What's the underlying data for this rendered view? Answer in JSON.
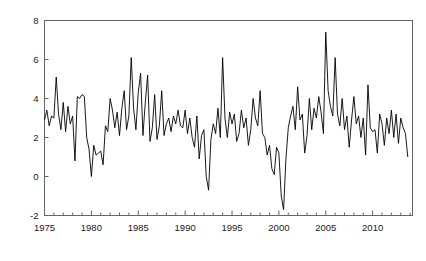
{
  "chart_data": {
    "type": "line",
    "title": "",
    "xlabel": "",
    "ylabel": "",
    "xlim": [
      1975.0,
      2014.25
    ],
    "ylim": [
      -2,
      8
    ],
    "grid": false,
    "legend": null,
    "x_ticks": [
      1975,
      1980,
      1985,
      1990,
      1995,
      2000,
      2005,
      2010
    ],
    "x_tick_labels": [
      "1975",
      "1980",
      "1985",
      "1990",
      "1995",
      "2000",
      "2005",
      "2010"
    ],
    "x_minor_tick_step": 1,
    "y_ticks": [
      -2,
      0,
      2,
      4,
      6,
      8
    ],
    "y_tick_labels": [
      "-2",
      "0",
      "2",
      "4",
      "6",
      "8"
    ],
    "line_color": "#000000",
    "line_width": 0.9,
    "series": [
      {
        "name": "series-1",
        "x_start": 1975.0,
        "x_step": 0.25,
        "values": [
          2.9,
          3.4,
          2.6,
          3.1,
          3.0,
          5.1,
          3.2,
          2.4,
          3.8,
          2.3,
          3.6,
          2.7,
          3.1,
          0.8,
          4.1,
          4.0,
          4.2,
          4.1,
          2.0,
          1.4,
          0.0,
          1.6,
          1.1,
          1.2,
          1.3,
          0.6,
          2.6,
          2.3,
          4.0,
          3.4,
          2.5,
          3.3,
          2.1,
          3.5,
          4.4,
          2.4,
          3.1,
          6.1,
          3.5,
          2.4,
          4.3,
          5.3,
          2.1,
          3.8,
          5.2,
          1.8,
          2.5,
          4.2,
          1.9,
          2.6,
          4.4,
          2.1,
          2.7,
          3.0,
          2.3,
          3.1,
          2.7,
          3.4,
          2.6,
          2.5,
          3.4,
          2.2,
          3.0,
          2.0,
          1.5,
          3.1,
          0.9,
          2.1,
          2.4,
          0.0,
          -0.7,
          1.9,
          2.7,
          2.2,
          3.5,
          2.0,
          6.1,
          3.0,
          2.0,
          3.3,
          2.7,
          3.2,
          1.8,
          2.2,
          3.4,
          2.5,
          3.0,
          1.6,
          2.4,
          4.0,
          3.0,
          2.6,
          4.4,
          2.2,
          2.0,
          1.1,
          1.6,
          0.4,
          0.1,
          1.5,
          1.2,
          -1.0,
          -1.7,
          0.9,
          2.5,
          3.1,
          3.6,
          2.4,
          4.6,
          2.9,
          3.2,
          1.2,
          2.1,
          4.0,
          2.4,
          3.5,
          3.0,
          4.1,
          3.3,
          2.2,
          7.4,
          4.4,
          3.6,
          3.1,
          6.1,
          3.2,
          2.6,
          4.0,
          2.4,
          3.1,
          1.5,
          2.9,
          4.1,
          2.7,
          3.1,
          2.0,
          3.0,
          1.1,
          4.7,
          2.5,
          2.3,
          2.4,
          1.2,
          3.2,
          2.7,
          1.6,
          3.0,
          2.2,
          3.4,
          2.0,
          3.2,
          1.7,
          3.0,
          2.5,
          2.2,
          1.0
        ]
      }
    ]
  }
}
